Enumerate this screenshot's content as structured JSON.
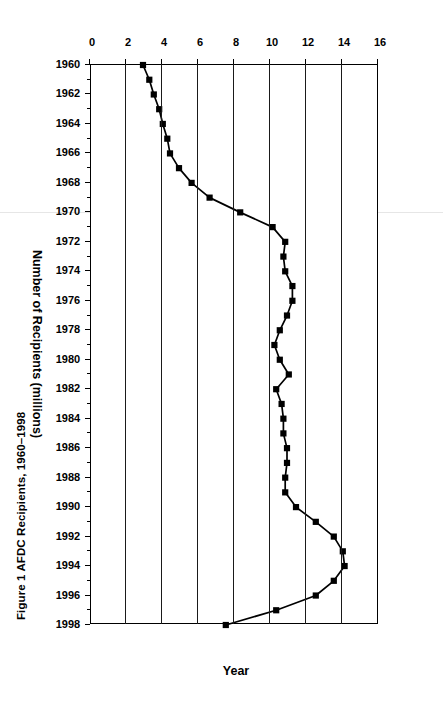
{
  "figure": {
    "caption": "Figure 1  AFDC Recipients, 1960–1998",
    "rotation_degrees": 90,
    "background_color": "#ffffff",
    "ink_color": "#000000"
  },
  "chart_data": {
    "type": "line",
    "title": "Figure 1  AFDC Recipients, 1960–1998",
    "xlabel": "Year",
    "ylabel": "Number of Recipients (millions)",
    "xlim": [
      1960,
      1998
    ],
    "ylim": [
      0,
      16
    ],
    "grid": true,
    "legend": false,
    "marker": "square",
    "marker_color": "#000000",
    "line_color": "#000000",
    "y_ticks": [
      0,
      2,
      4,
      6,
      8,
      10,
      12,
      14,
      16
    ],
    "y_tick_labels": [
      "0",
      "2",
      "4",
      "6",
      "8",
      "10",
      "12",
      "14",
      "16"
    ],
    "x_ticks": [
      1960,
      1962,
      1964,
      1966,
      1968,
      1970,
      1972,
      1974,
      1976,
      1978,
      1980,
      1982,
      1984,
      1986,
      1988,
      1990,
      1992,
      1994,
      1996,
      1998
    ],
    "x_tick_labels": [
      "1960",
      "1962",
      "1964",
      "1966",
      "1968",
      "1970",
      "1972",
      "1974",
      "1976",
      "1978",
      "1980",
      "1982",
      "1984",
      "1986",
      "1988",
      "1990",
      "1992",
      "1994",
      "1996",
      "1998"
    ],
    "x": [
      1960,
      1961,
      1962,
      1963,
      1964,
      1965,
      1966,
      1967,
      1968,
      1969,
      1970,
      1971,
      1972,
      1973,
      1974,
      1975,
      1976,
      1977,
      1978,
      1979,
      1980,
      1981,
      1982,
      1983,
      1984,
      1985,
      1986,
      1987,
      1988,
      1989,
      1990,
      1991,
      1992,
      1993,
      1994,
      1995,
      1996,
      1997,
      1998
    ],
    "values": [
      3.0,
      3.35,
      3.6,
      3.9,
      4.1,
      4.35,
      4.5,
      5.0,
      5.7,
      6.7,
      8.4,
      10.2,
      10.9,
      10.8,
      10.9,
      11.3,
      11.3,
      11.0,
      10.6,
      10.3,
      10.6,
      11.1,
      10.4,
      10.7,
      10.8,
      10.8,
      11.0,
      11.0,
      10.9,
      10.9,
      11.5,
      12.6,
      13.6,
      14.1,
      14.2,
      13.6,
      12.6,
      10.4,
      7.6
    ]
  }
}
